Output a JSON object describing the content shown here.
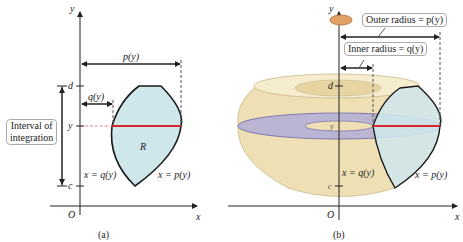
{
  "panel_a": {
    "caption": "(a)",
    "axis_x": "x",
    "axis_y": "y",
    "origin": "O",
    "tick_d": "d",
    "tick_c": "c",
    "tick_y": "y",
    "p_label": "p(y)",
    "q_label": "q(y)",
    "region_label": "R",
    "curve_left": "x = q(y)",
    "curve_right": "x = p(y)",
    "interval_line1": "Interval of",
    "interval_line2": "integration"
  },
  "panel_b": {
    "caption": "(b)",
    "axis_x": "x",
    "axis_y": "y",
    "origin": "O",
    "tick_d": "d",
    "tick_c": "c",
    "tick_y": "y",
    "outer_radius": "Outer radius = p(y)",
    "inner_radius": "Inner radius = q(y)",
    "curve_left": "x = q(y)",
    "curve_right": "x = p(y)"
  },
  "colors": {
    "region_fill": "#cfe6ea",
    "solid_fill": "#eedfb5",
    "washer_fill": "#a9a6dd",
    "red_line": "#d8262b",
    "curve": "#1a1a1a"
  }
}
